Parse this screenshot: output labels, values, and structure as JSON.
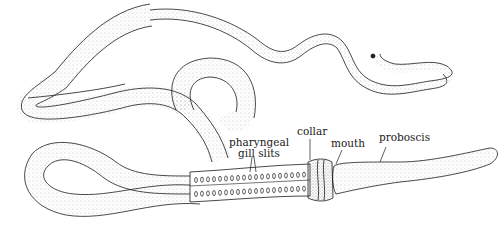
{
  "diagram": {
    "labels": [
      {
        "id": "gill-slits",
        "lines": [
          "pharyngeal",
          "gill slits"
        ]
      },
      {
        "id": "collar",
        "lines": [
          "collar"
        ]
      },
      {
        "id": "mouth",
        "lines": [
          "mouth"
        ]
      },
      {
        "id": "proboscis",
        "lines": [
          "proboscis"
        ]
      }
    ],
    "colors": {
      "ink": "#1a1a1a",
      "stipple": "#777777",
      "background": "#ffffff"
    }
  }
}
